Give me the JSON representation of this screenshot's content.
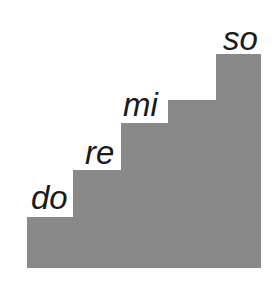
{
  "diagram": {
    "type": "staircase",
    "fill_color": "#898989",
    "text_color": "#1a1a1a",
    "steps": [
      {
        "label": "do",
        "left": 27,
        "top": 217
      },
      {
        "label": "re",
        "left": 73,
        "top": 170
      },
      {
        "label": "mi",
        "left": 121,
        "top": 123
      },
      {
        "label": "so",
        "left": 168,
        "top": 100,
        "label_hidden": true
      },
      {
        "label": "",
        "left": 216,
        "top": 54
      }
    ],
    "labels": [
      {
        "text": "do",
        "x": 31,
        "y": 181
      },
      {
        "text": "re",
        "x": 85,
        "y": 136
      },
      {
        "text": "mi",
        "x": 123,
        "y": 88
      },
      {
        "text": "so",
        "x": 223,
        "y": 22
      }
    ],
    "bottom": 268,
    "right": 261
  }
}
